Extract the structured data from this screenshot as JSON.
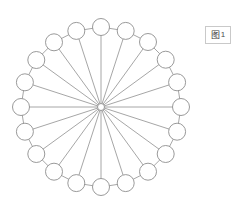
{
  "figure": {
    "canvas": {
      "width": 242,
      "height": 214,
      "background": "#ffffff"
    },
    "caption_box": {
      "glyph": "图",
      "number": "1",
      "border_color": "#c9c9c9",
      "text_color": "#3a3a3a"
    },
    "diagram": {
      "type": "wheel-graph",
      "node_count": 20,
      "has_center_hub": true,
      "center": {
        "x": 101,
        "y": 107
      },
      "ring_radius": 80,
      "node_radius": 8.5,
      "hub_radius": 3.5,
      "stroke_color": "#8f8f8f",
      "node_fill": "#ffffff",
      "start_angle_deg": -90,
      "nodes": [
        {
          "id": "n1",
          "angle_deg": -90,
          "x": 101.0,
          "y": 27.0
        },
        {
          "id": "n2",
          "angle_deg": -72,
          "x": 125.7,
          "y": 30.9
        },
        {
          "id": "n3",
          "angle_deg": -54,
          "x": 148.0,
          "y": 42.0
        },
        {
          "id": "n4",
          "angle_deg": -36,
          "x": 165.7,
          "y": 59.7
        },
        {
          "id": "n5",
          "angle_deg": -18,
          "x": 177.1,
          "y": 82.3
        },
        {
          "id": "n6",
          "angle_deg": 0,
          "x": 181.0,
          "y": 107.0
        },
        {
          "id": "n7",
          "angle_deg": 18,
          "x": 177.1,
          "y": 131.7
        },
        {
          "id": "n8",
          "angle_deg": 36,
          "x": 165.7,
          "y": 154.0
        },
        {
          "id": "n9",
          "angle_deg": 54,
          "x": 148.0,
          "y": 171.7
        },
        {
          "id": "n10",
          "angle_deg": 72,
          "x": 125.7,
          "y": 183.1
        },
        {
          "id": "n11",
          "angle_deg": 90,
          "x": 101.0,
          "y": 187.0
        },
        {
          "id": "n12",
          "angle_deg": 108,
          "x": 76.3,
          "y": 183.1
        },
        {
          "id": "n13",
          "angle_deg": 126,
          "x": 54.0,
          "y": 171.7
        },
        {
          "id": "n14",
          "angle_deg": 144,
          "x": 36.3,
          "y": 154.0
        },
        {
          "id": "n15",
          "angle_deg": 162,
          "x": 24.9,
          "y": 131.7
        },
        {
          "id": "n16",
          "angle_deg": 180,
          "x": 21.0,
          "y": 107.0
        },
        {
          "id": "n17",
          "angle_deg": 198,
          "x": 24.9,
          "y": 82.3
        },
        {
          "id": "n18",
          "angle_deg": 216,
          "x": 36.3,
          "y": 60.0
        },
        {
          "id": "n19",
          "angle_deg": 234,
          "x": 54.0,
          "y": 42.3
        },
        {
          "id": "n20",
          "angle_deg": 252,
          "x": 76.3,
          "y": 30.9
        }
      ],
      "ring_edges": [
        [
          "n1",
          "n2"
        ],
        [
          "n2",
          "n3"
        ],
        [
          "n3",
          "n4"
        ],
        [
          "n4",
          "n5"
        ],
        [
          "n5",
          "n6"
        ],
        [
          "n6",
          "n7"
        ],
        [
          "n7",
          "n8"
        ],
        [
          "n8",
          "n9"
        ],
        [
          "n9",
          "n10"
        ],
        [
          "n10",
          "n11"
        ],
        [
          "n11",
          "n12"
        ],
        [
          "n12",
          "n13"
        ],
        [
          "n13",
          "n14"
        ],
        [
          "n14",
          "n15"
        ],
        [
          "n15",
          "n16"
        ],
        [
          "n16",
          "n17"
        ],
        [
          "n17",
          "n18"
        ],
        [
          "n18",
          "n19"
        ],
        [
          "n19",
          "n20"
        ],
        [
          "n20",
          "n1"
        ]
      ],
      "spoke_edges": [
        "n1",
        "n2",
        "n3",
        "n4",
        "n5",
        "n6",
        "n7",
        "n8",
        "n9",
        "n10",
        "n11",
        "n12",
        "n13",
        "n14",
        "n15",
        "n16",
        "n17",
        "n18",
        "n19",
        "n20"
      ]
    }
  }
}
